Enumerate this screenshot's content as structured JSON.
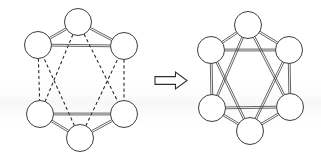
{
  "figure": {
    "title": "Graph edge-completion transformation",
    "background_color": "#ffffff",
    "width": 321,
    "height": 161,
    "node_fill": "#ffffff",
    "node_stroke": "#3d3d3d",
    "solid_edge_color": "#4a4a4a",
    "dashed_edge_color": "#222222",
    "arrow_fill": "#ffffff",
    "arrow_stroke": "#2e2e2e"
  },
  "left_graph": {
    "name": "source-graph",
    "caption": "",
    "node_radius": 13.5,
    "nodes": [
      {
        "id": "t",
        "label": "",
        "cx": 78,
        "cy": 22
      },
      {
        "id": "ul",
        "label": "",
        "cx": 38,
        "cy": 45
      },
      {
        "id": "ur",
        "label": "",
        "cx": 124,
        "cy": 46
      },
      {
        "id": "ll",
        "label": "",
        "cx": 40,
        "cy": 114
      },
      {
        "id": "lr",
        "label": "",
        "cx": 124,
        "cy": 114
      },
      {
        "id": "b",
        "label": "",
        "cx": 80,
        "cy": 138
      }
    ],
    "solid_edges": [
      {
        "from": "t",
        "to": "ul"
      },
      {
        "from": "t",
        "to": "ur"
      },
      {
        "from": "ul",
        "to": "ur"
      },
      {
        "from": "b",
        "to": "ll"
      },
      {
        "from": "b",
        "to": "lr"
      },
      {
        "from": "ll",
        "to": "lr"
      }
    ],
    "dashed_edges": [
      {
        "from": "ul",
        "to": "ll"
      },
      {
        "from": "ur",
        "to": "lr"
      },
      {
        "from": "t",
        "to": "ll"
      },
      {
        "from": "t",
        "to": "lr"
      },
      {
        "from": "b",
        "to": "ul"
      },
      {
        "from": "b",
        "to": "ur"
      }
    ]
  },
  "arrow": {
    "name": "transformation-arrow",
    "direction": "right",
    "style": "hollow-outline",
    "x": 155,
    "y": 72,
    "width": 32,
    "height": 17
  },
  "right_graph": {
    "name": "result-graph",
    "caption": "",
    "node_radius": 13.5,
    "nodes": [
      {
        "id": "t",
        "label": "",
        "cx": 248,
        "cy": 25
      },
      {
        "id": "ul",
        "label": "",
        "cx": 211,
        "cy": 50
      },
      {
        "id": "ur",
        "label": "",
        "cx": 289,
        "cy": 50
      },
      {
        "id": "ll",
        "label": "",
        "cx": 212,
        "cy": 108
      },
      {
        "id": "lr",
        "label": "",
        "cx": 290,
        "cy": 107
      },
      {
        "id": "b",
        "label": "",
        "cx": 250,
        "cy": 131
      }
    ],
    "solid_edges": [
      {
        "from": "t",
        "to": "ul"
      },
      {
        "from": "t",
        "to": "ur"
      },
      {
        "from": "ul",
        "to": "ur"
      },
      {
        "from": "b",
        "to": "ll"
      },
      {
        "from": "b",
        "to": "lr"
      },
      {
        "from": "ll",
        "to": "lr"
      },
      {
        "from": "ul",
        "to": "ll"
      },
      {
        "from": "ur",
        "to": "lr"
      },
      {
        "from": "t",
        "to": "ll"
      },
      {
        "from": "t",
        "to": "lr"
      },
      {
        "from": "b",
        "to": "ul"
      },
      {
        "from": "b",
        "to": "ur"
      }
    ],
    "dashed_edges": []
  }
}
